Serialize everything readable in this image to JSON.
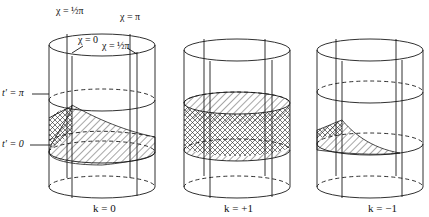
{
  "figure": {
    "panels": [
      {
        "id": "flat",
        "caption": "k = 0"
      },
      {
        "id": "closed",
        "caption": "k = +1"
      },
      {
        "id": "open",
        "caption": "k = −1"
      }
    ],
    "axis_labels": {
      "t_pi": "t′ = π",
      "t_zero": "t′ = 0"
    },
    "chi_labels": {
      "half_pi_top": "χ = ½π",
      "pi": "χ = π",
      "zero": "χ = 0",
      "half_pi_inner": "χ = ½π"
    },
    "colors": {
      "line": "#1a1a1a",
      "background": "#ffffff"
    }
  }
}
